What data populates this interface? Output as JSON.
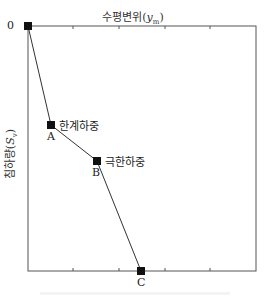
{
  "x_axis": {
    "title_main": "수평변위(",
    "title_var": "y",
    "title_sub": "m",
    "title_close": ")"
  },
  "y_axis": {
    "title_main": "침하량(",
    "title_var": "S",
    "title_sub": "v",
    "title_close": ")"
  },
  "points": [
    {
      "id": "O",
      "label": "0",
      "annotation": ""
    },
    {
      "id": "A",
      "label": "A",
      "annotation": "한계하중"
    },
    {
      "id": "B",
      "label": "B",
      "annotation": "극한하중"
    },
    {
      "id": "C",
      "label": "C",
      "annotation": ""
    }
  ],
  "colors": {
    "line": "#333333",
    "marker": "#111111",
    "frame": "#555555"
  }
}
